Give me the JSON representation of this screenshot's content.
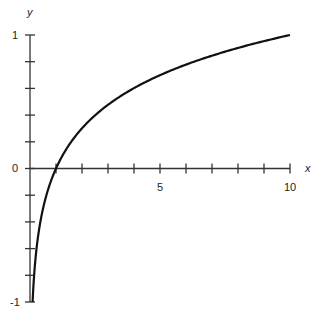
{
  "chart_data": {
    "type": "line",
    "title": "",
    "xlabel": "x",
    "ylabel": "y",
    "xlim": [
      0,
      10
    ],
    "ylim": [
      -1,
      1
    ],
    "grid": false,
    "x_ticks": [
      0,
      1,
      2,
      3,
      4,
      5,
      6,
      7,
      8,
      9,
      10
    ],
    "x_tick_labels": {
      "5": "5",
      "10": "10"
    },
    "y_ticks": [
      -1,
      -0.8,
      -0.6,
      -0.4,
      -0.2,
      0,
      0.2,
      0.4,
      0.6,
      0.8,
      1
    ],
    "y_tick_labels": {
      "-1": "-1",
      "0": "0",
      "1": "1"
    },
    "series": [
      {
        "name": "y = log10(x)",
        "x": [
          0.1,
          0.2,
          0.3,
          0.5,
          0.75,
          1,
          1.5,
          2,
          3,
          4,
          5,
          6,
          7,
          8,
          9,
          10
        ],
        "y": [
          -1,
          -0.699,
          -0.523,
          -0.301,
          -0.125,
          0,
          0.176,
          0.301,
          0.477,
          0.602,
          0.699,
          0.778,
          0.845,
          0.903,
          0.954,
          1
        ],
        "color": "#111111"
      }
    ]
  },
  "labels": {
    "x_axis": "x",
    "y_axis": "y",
    "x_tick_5": "5",
    "x_tick_10": "10",
    "y_tick_1": "1",
    "y_tick_0": "0",
    "y_tick_neg1": "-1"
  }
}
